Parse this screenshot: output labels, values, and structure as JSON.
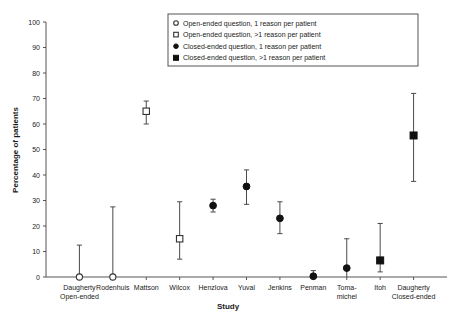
{
  "chart_data": {
    "type": "scatter",
    "title": "",
    "xlabel": "Study",
    "ylabel": "Percentage of patients",
    "ylim": [
      0,
      100
    ],
    "yticks": [
      0,
      10,
      20,
      30,
      40,
      50,
      60,
      70,
      80,
      90,
      100
    ],
    "grid": false,
    "legend_position": "top-right",
    "categories": [
      "Daugherty Open-ended",
      "Rodenhuis",
      "Mattson",
      "Wilcox",
      "Henzlova",
      "Yuval",
      "Jenkins",
      "Penman",
      "Toma-michel",
      "Itoh",
      "Daugherty Closed-ended"
    ],
    "category_labels": [
      [
        "Daugherty",
        "Open-ended"
      ],
      [
        "Rodenhuis",
        ""
      ],
      [
        "Mattson",
        ""
      ],
      [
        "Wilcox",
        ""
      ],
      [
        "Henzlova",
        ""
      ],
      [
        "Yuval",
        ""
      ],
      [
        "Jenkins",
        ""
      ],
      [
        "Penman",
        ""
      ],
      [
        "Toma-",
        "michel"
      ],
      [
        "Itoh",
        ""
      ],
      [
        "Daugherty",
        "Closed-ended"
      ]
    ],
    "series": [
      {
        "name": "Open-ended question, 1 reason per patient",
        "marker": "open-circle",
        "points": [
          {
            "category": "Daugherty Open-ended",
            "x": 1,
            "value": 0,
            "low": 0,
            "high": 12.5
          },
          {
            "category": "Rodenhuis",
            "x": 2,
            "value": 0,
            "low": 0,
            "high": 27.5
          }
        ]
      },
      {
        "name": "Open-ended question, >1 reason per patient",
        "marker": "open-square",
        "points": [
          {
            "category": "Mattson",
            "x": 3,
            "value": 65,
            "low": 60,
            "high": 69
          },
          {
            "category": "Wilcox",
            "x": 4,
            "value": 15,
            "low": 7,
            "high": 29.5
          }
        ]
      },
      {
        "name": "Closed-ended question, 1 reason per patient",
        "marker": "filled-circle",
        "points": [
          {
            "category": "Henzlova",
            "x": 5,
            "value": 28,
            "low": 25.5,
            "high": 30.5
          },
          {
            "category": "Yuval",
            "x": 6,
            "value": 35.5,
            "low": 28.5,
            "high": 42
          },
          {
            "category": "Jenkins",
            "x": 7,
            "value": 23,
            "low": 17,
            "high": 29.5
          },
          {
            "category": "Penman",
            "x": 8,
            "value": 0.3,
            "low": 0,
            "high": 2.5
          },
          {
            "category": "Toma-michel",
            "x": 9,
            "value": 3.5,
            "low": 0,
            "high": 15
          }
        ]
      },
      {
        "name": "Closed-ended question, >1 reason per patient",
        "marker": "filled-square",
        "points": [
          {
            "category": "Itoh",
            "x": 10,
            "value": 6.5,
            "low": 2,
            "high": 21
          },
          {
            "category": "Daugherty Closed-ended",
            "x": 11,
            "value": 55.5,
            "low": 37.5,
            "high": 72
          }
        ]
      }
    ]
  },
  "legend": {
    "entries": [
      {
        "marker": "open-circle",
        "label": "Open-ended question, 1 reason per patient"
      },
      {
        "marker": "open-square",
        "label": "Open-ended question, >1 reason per patient"
      },
      {
        "marker": "filled-circle",
        "label": "Closed-ended question, 1 reason per patient"
      },
      {
        "marker": "filled-square",
        "label": "Closed-ended question, >1 reason per patient"
      }
    ]
  },
  "colors": {
    "marker_fill": "#111111",
    "marker_open_fill": "#ffffff",
    "axis": "#555555",
    "text": "#1a1a1a",
    "background": "#ffffff"
  }
}
